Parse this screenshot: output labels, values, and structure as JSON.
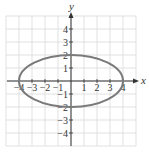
{
  "chart_data": {
    "type": "line",
    "title": "",
    "xlabel": "x",
    "ylabel": "y",
    "xlim": [
      -5,
      5
    ],
    "ylim": [
      -5,
      5
    ],
    "grid": true,
    "x_ticks": [
      -4,
      -3,
      -2,
      -1,
      1,
      2,
      3,
      4
    ],
    "y_ticks": [
      -4,
      -3,
      -2,
      -1,
      1,
      2,
      3,
      4
    ],
    "x_tick_labels": [
      "-4",
      "-3",
      "-2",
      "-1",
      "1",
      "2",
      "3",
      "4"
    ],
    "y_tick_labels": [
      "-4",
      "-3",
      "-2",
      "-1",
      "1",
      "2",
      "3",
      "4"
    ],
    "series": [
      {
        "name": "ellipse",
        "shape": "ellipse",
        "center": [
          0,
          0
        ],
        "semi_major_x": 4,
        "semi_minor_y": 2,
        "vertices": [
          [
            -4,
            0
          ],
          [
            4,
            0
          ],
          [
            0,
            2
          ],
          [
            0,
            -2
          ]
        ],
        "color": "#7a7a7a"
      }
    ]
  },
  "colors": {
    "grid": "#d9d9d9",
    "axis": "#333333",
    "curve": "#7a7a7a"
  }
}
